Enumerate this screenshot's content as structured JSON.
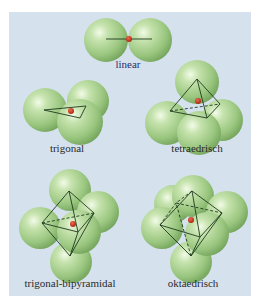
{
  "figure": {
    "title": "",
    "background_color": "#d5e2ee",
    "sphere_color": "#9fcb86",
    "center_atom_color": "#c0392b",
    "line_color": "#1f3a1f"
  },
  "geometries": [
    {
      "id": "linear",
      "label": "linear"
    },
    {
      "id": "trigonal",
      "label": "trigonal"
    },
    {
      "id": "tetrahedral",
      "label": "tetraedrisch"
    },
    {
      "id": "trigonal-bipyramidal",
      "label": "trigonal-bipyramidal"
    },
    {
      "id": "octahedral",
      "label": "oktaedrisch"
    }
  ]
}
